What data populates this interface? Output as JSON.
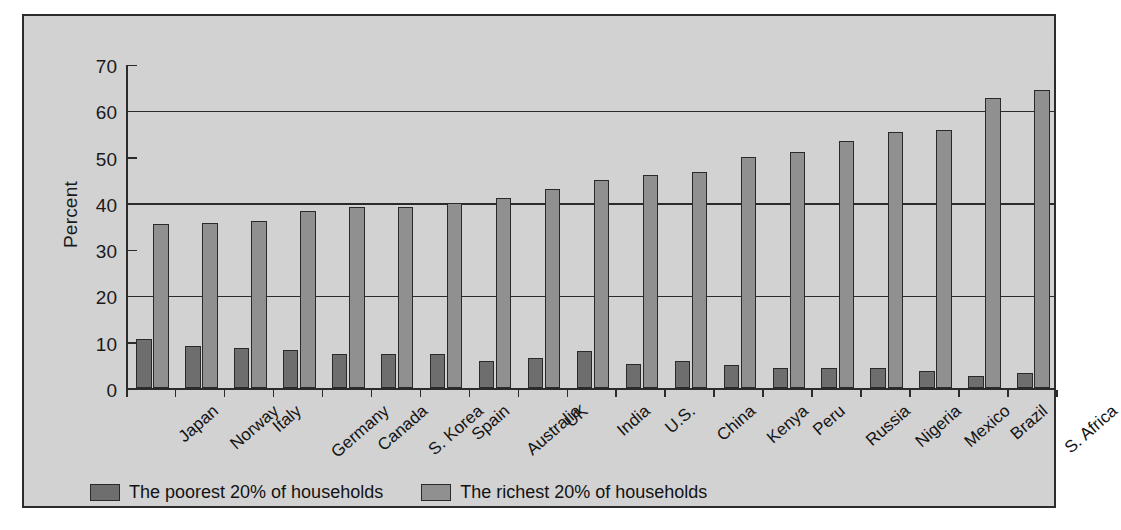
{
  "chart_data": {
    "type": "bar",
    "title": "",
    "xlabel": "",
    "ylabel": "Percent",
    "ylim": [
      0,
      70
    ],
    "ytick_labels": [
      "0",
      "10",
      "20",
      "30",
      "40",
      "50",
      "60",
      "70"
    ],
    "yticks": [
      0,
      10,
      20,
      30,
      40,
      50,
      60,
      70
    ],
    "gridlines_at": [
      20,
      40,
      60
    ],
    "grid": true,
    "legend_position": "bottom",
    "categories": [
      "Japan",
      "Norway",
      "Italy",
      "Germany",
      "Canada",
      "S. Korea",
      "Spain",
      "Australia",
      "UK",
      "India",
      "U.S.",
      "China",
      "Kenya",
      "Peru",
      "Russia",
      "Nigeria",
      "Mexico",
      "Brazil",
      "S. Africa"
    ],
    "series": [
      {
        "name": "The poorest 20% of households",
        "color": "#6e6e6e",
        "values": [
          10.6,
          9.2,
          8.7,
          8.2,
          7.5,
          7.5,
          7.5,
          5.9,
          6.6,
          8.1,
          5.2,
          5.9,
          5.0,
          4.4,
          4.4,
          4.4,
          3.6,
          2.6,
          3.3
        ]
      },
      {
        "name": "The richest 20% of households",
        "color": "#909090",
        "values": [
          35.7,
          35.8,
          36.3,
          38.5,
          39.3,
          39.3,
          40.3,
          41.3,
          43.2,
          45.3,
          46.4,
          46.9,
          50.2,
          51.2,
          53.7,
          55.7,
          56.1,
          63.0,
          64.8
        ]
      }
    ]
  },
  "legend": {
    "items": [
      {
        "label": "The poorest 20% of households",
        "swatch": "poor"
      },
      {
        "label": "The richest 20% of households",
        "swatch": "rich"
      }
    ]
  }
}
